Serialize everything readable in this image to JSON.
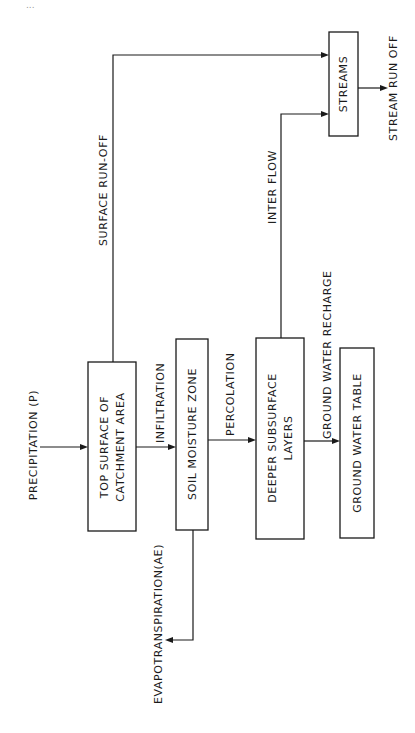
{
  "page_number": "...",
  "diagram": {
    "orientation": "rotated 90° counter-clockwise",
    "nodes": [
      {
        "id": "top_surface",
        "lines": [
          "TOP SURFACE OF",
          "CATCHMENT AREA"
        ]
      },
      {
        "id": "soil_moisture",
        "lines": [
          "SOIL MOISTURE ZONE"
        ]
      },
      {
        "id": "deeper_subsurface",
        "lines": [
          "DEEPER SUBSURFACE",
          "LAYERS"
        ]
      },
      {
        "id": "ground_water_table",
        "lines": [
          "GROUND WATER TABLE"
        ]
      },
      {
        "id": "streams",
        "lines": [
          "STREAMS"
        ]
      }
    ],
    "edges": [
      {
        "from": "input",
        "to": "top_surface",
        "label": "PRECIPITATION (P)"
      },
      {
        "from": "top_surface",
        "to": "soil_moisture",
        "label": "INFILTRATION"
      },
      {
        "from": "soil_moisture",
        "to": "deeper_subsurface",
        "label": "PERCOLATION"
      },
      {
        "from": "deeper_subsurface",
        "to": "ground_water_table",
        "label": "GROUND WATER RECHARGE"
      },
      {
        "from": "top_surface",
        "to": "streams",
        "label": "SURFACE RUN-OFF"
      },
      {
        "from": "deeper_subsurface",
        "to": "streams",
        "label": "INTER FLOW"
      },
      {
        "from": "streams",
        "to": "output",
        "label": "STREAM RUN OFF"
      },
      {
        "from": "soil_moisture",
        "to": "output",
        "label": "EVAPOTRANSPIRATION(AE)"
      }
    ]
  },
  "labels": {
    "precipitation": "PRECIPITATION (P)",
    "infiltration": "INFILTRATION",
    "percolation": "PERCOLATION",
    "ground_water_recharge": "GROUND WATER RECHARGE",
    "surface_runoff": "SURFACE RUN-OFF",
    "inter_flow": "INTER FLOW",
    "stream_runoff": "STREAM RUN OFF",
    "evapotranspiration": "EVAPOTRANSPIRATION(AE)"
  },
  "boxes": {
    "top_surface_line1": "TOP SURFACE OF",
    "top_surface_line2": "CATCHMENT AREA",
    "soil_moisture": "SOIL MOISTURE ZONE",
    "deeper_line1": "DEEPER SUBSURFACE",
    "deeper_line2": "LAYERS",
    "ground_water_table": "GROUND WATER TABLE",
    "streams": "STREAMS"
  }
}
